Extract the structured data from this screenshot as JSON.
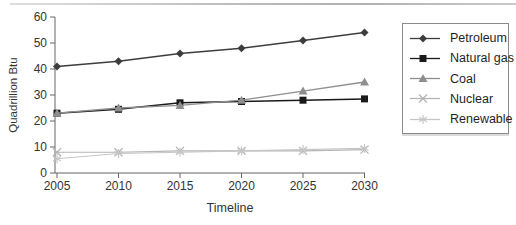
{
  "figure": {
    "background": "#ffffff",
    "axis_color": "#666666",
    "text_color": "#333333"
  },
  "chart_data": {
    "type": "line",
    "title": "",
    "xlabel": "Timeline",
    "ylabel": "Quadrillion Btu",
    "x": [
      2005,
      2010,
      2015,
      2020,
      2025,
      2030
    ],
    "ylim": [
      0,
      60
    ],
    "yticks": [
      0,
      10,
      20,
      30,
      40,
      50,
      60
    ],
    "grid": false,
    "legend_position": "right",
    "series": [
      {
        "name": "Petroleum",
        "marker": "diamond",
        "color": "#3d3d3d",
        "values": [
          41,
          43,
          46,
          48,
          51,
          54
        ]
      },
      {
        "name": "Natural gas",
        "marker": "square",
        "color": "#1a1a1a",
        "values": [
          23,
          24.5,
          27,
          27.5,
          28,
          28.5
        ]
      },
      {
        "name": "Coal",
        "marker": "triangle",
        "color": "#8e8e8e",
        "values": [
          23,
          25,
          26,
          28,
          31.5,
          35
        ]
      },
      {
        "name": "Nuclear",
        "marker": "x",
        "color": "#b4b4b4",
        "values": [
          8,
          8,
          8.5,
          8.5,
          8.5,
          9
        ]
      },
      {
        "name": "Renewable",
        "marker": "asterisk",
        "color": "#c6c6c6",
        "values": [
          5.5,
          7.5,
          8,
          8.5,
          9,
          9.5
        ]
      }
    ]
  }
}
